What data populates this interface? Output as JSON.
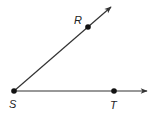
{
  "diagram": {
    "type": "angle",
    "vertex": {
      "label": "S",
      "x": 14,
      "y": 91
    },
    "rays": [
      {
        "name": "ray-SR",
        "point": {
          "label": "R",
          "x": 88,
          "y": 27
        },
        "tip": {
          "x": 112,
          "y": 6
        }
      },
      {
        "name": "ray-ST",
        "point": {
          "label": "T",
          "x": 114,
          "y": 91
        },
        "tip": {
          "x": 148,
          "y": 91
        }
      }
    ],
    "labels": {
      "R": "R",
      "S": "S",
      "T": "T"
    },
    "colors": {
      "stroke": "#333333",
      "point": "#111111"
    }
  }
}
